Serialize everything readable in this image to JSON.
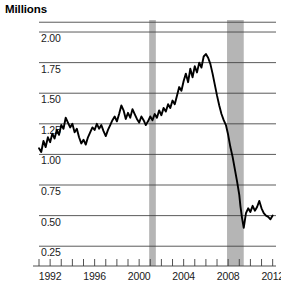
{
  "chart_title": "Millions",
  "chart_data": {
    "type": "line",
    "title": "Millions",
    "subtitle": "",
    "xlabel": "",
    "ylabel": "Millions",
    "xlim": [
      1991.0,
      2012.3
    ],
    "ylim": [
      0.17,
      2.09
    ],
    "grid": true,
    "gridlines_y": [
      0.25,
      0.5,
      0.75,
      1.0,
      1.25,
      1.5,
      1.75,
      2.0,
      2.08
    ],
    "legend": "none",
    "ytick_labels": [
      "2.00",
      "1.75",
      "1.50",
      "1.25",
      "1.00",
      "0.75",
      "0.50",
      "0.25"
    ],
    "ytick_values": [
      2.0,
      1.75,
      1.5,
      1.25,
      1.0,
      0.75,
      0.5,
      0.25
    ],
    "xtick_labels": [
      "1992",
      "1996",
      "2000",
      "2004",
      "2008",
      "2012"
    ],
    "xtick_values": [
      1992,
      1996,
      2000,
      2004,
      2008,
      2012
    ],
    "xtick_minor_values": [
      1991,
      1992,
      1993,
      1994,
      1995,
      1996,
      1997,
      1998,
      1999,
      2000,
      2001,
      2002,
      2003,
      2004,
      2005,
      2006,
      2007,
      2008,
      2009,
      2010,
      2011,
      2012
    ],
    "line_color": "#000000",
    "line_width": 1.9,
    "shaded_bands": [
      {
        "name": "recession-2001",
        "x_start": 2000.9,
        "x_end": 2001.5,
        "color": "#b5b5b5"
      },
      {
        "name": "recession-2008",
        "x_start": 2007.9,
        "x_end": 2009.4,
        "color": "#b5b5b5"
      }
    ],
    "series": [
      {
        "name": "housing-starts",
        "color": "#000000",
        "x": [
          1991.0,
          1991.2,
          1991.4,
          1991.6,
          1991.8,
          1992.0,
          1992.2,
          1992.4,
          1992.6,
          1992.8,
          1993.0,
          1993.2,
          1993.4,
          1993.6,
          1993.8,
          1994.0,
          1994.2,
          1994.4,
          1994.6,
          1994.8,
          1995.0,
          1995.2,
          1995.4,
          1995.6,
          1995.8,
          1996.0,
          1996.2,
          1996.4,
          1996.6,
          1996.8,
          1997.0,
          1997.2,
          1997.4,
          1997.6,
          1997.8,
          1998.0,
          1998.2,
          1998.4,
          1998.6,
          1998.8,
          1999.0,
          1999.2,
          1999.4,
          1999.6,
          1999.8,
          2000.0,
          2000.2,
          2000.4,
          2000.6,
          2000.8,
          2001.0,
          2001.2,
          2001.4,
          2001.6,
          2001.8,
          2002.0,
          2002.2,
          2002.4,
          2002.6,
          2002.8,
          2003.0,
          2003.2,
          2003.4,
          2003.6,
          2003.8,
          2004.0,
          2004.2,
          2004.4,
          2004.6,
          2004.8,
          2005.0,
          2005.2,
          2005.4,
          2005.6,
          2005.8,
          2006.0,
          2006.2,
          2006.4,
          2006.6,
          2006.8,
          2007.0,
          2007.2,
          2007.4,
          2007.6,
          2007.8,
          2008.0,
          2008.2,
          2008.4,
          2008.6,
          2008.8,
          2009.0,
          2009.1,
          2009.25,
          2009.4,
          2009.6,
          2009.8,
          2010.0,
          2010.2,
          2010.4,
          2010.6,
          2010.8,
          2011.0,
          2011.2,
          2011.4,
          2011.6,
          2011.8,
          2012.0
        ],
        "values": [
          1.05,
          1.02,
          1.11,
          1.06,
          1.14,
          1.1,
          1.17,
          1.13,
          1.2,
          1.16,
          1.24,
          1.21,
          1.3,
          1.26,
          1.22,
          1.25,
          1.18,
          1.21,
          1.14,
          1.09,
          1.12,
          1.08,
          1.14,
          1.18,
          1.22,
          1.2,
          1.25,
          1.21,
          1.24,
          1.19,
          1.15,
          1.2,
          1.24,
          1.28,
          1.31,
          1.27,
          1.33,
          1.4,
          1.36,
          1.29,
          1.34,
          1.3,
          1.37,
          1.33,
          1.29,
          1.26,
          1.31,
          1.28,
          1.24,
          1.27,
          1.31,
          1.28,
          1.33,
          1.3,
          1.36,
          1.32,
          1.38,
          1.35,
          1.41,
          1.38,
          1.44,
          1.41,
          1.48,
          1.55,
          1.52,
          1.6,
          1.66,
          1.59,
          1.7,
          1.63,
          1.72,
          1.67,
          1.75,
          1.71,
          1.8,
          1.82,
          1.79,
          1.74,
          1.66,
          1.57,
          1.48,
          1.4,
          1.33,
          1.28,
          1.24,
          1.16,
          1.06,
          0.98,
          0.88,
          0.78,
          0.67,
          0.58,
          0.48,
          0.4,
          0.52,
          0.56,
          0.53,
          0.58,
          0.54,
          0.57,
          0.62,
          0.56,
          0.52,
          0.5,
          0.49,
          0.47,
          0.5
        ]
      }
    ]
  }
}
